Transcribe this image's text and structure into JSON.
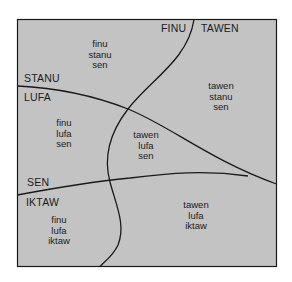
{
  "colors": {
    "background": "#ffffff",
    "box_fill": "#c3c3c3",
    "line": "#1a1a1a",
    "text": "#1c1c1c"
  },
  "boundary_labels": {
    "finu": "FINU",
    "tawen": "TAWEN",
    "stanu": "STANU",
    "lufa": "LUFA",
    "sen": "SEN",
    "iktaw": "IKTAW"
  },
  "regions": [
    {
      "id": "finu-stanu-sen",
      "lines": [
        "finu",
        "stanu",
        "sen"
      ]
    },
    {
      "id": "tawen-stanu-sen",
      "lines": [
        "tawen",
        "stanu",
        "sen"
      ]
    },
    {
      "id": "finu-lufa-sen",
      "lines": [
        "finu",
        "lufa",
        "sen"
      ]
    },
    {
      "id": "tawen-lufa-sen",
      "lines": [
        "tawen",
        "lufa",
        "sen"
      ]
    },
    {
      "id": "finu-lufa-iktaw",
      "lines": [
        "finu",
        "lufa",
        "iktaw"
      ]
    },
    {
      "id": "tawen-lufa-iktaw",
      "lines": [
        "tawen",
        "lufa",
        "iktaw"
      ]
    }
  ]
}
